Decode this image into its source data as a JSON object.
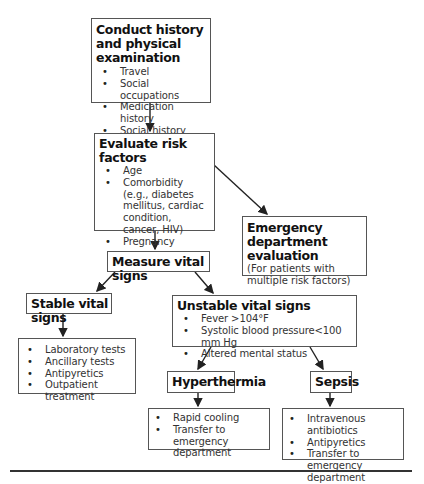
{
  "nodes": {
    "history": {
      "title": "Conduct history and physical examination",
      "items": [
        "Travel",
        "Social occupations",
        "Medication history",
        "Social history"
      ]
    },
    "risk": {
      "title": "Evaluate risk factors",
      "items": [
        "Age",
        "Comorbidity (e.g., diabetes mellitus, cardiac condition, cancer, HIV)",
        "Pregnancy"
      ]
    },
    "ed_eval": {
      "title": "Emergency department evaluation",
      "note": "(For patients with multiple risk factors)"
    },
    "measure": {
      "title": "Measure vital signs"
    },
    "stable": {
      "title": "Stable vital signs"
    },
    "stable_actions": {
      "items": [
        "Laboratory tests",
        "Ancillary tests",
        "Antipyretics",
        "Outpatient treatment"
      ]
    },
    "unstable": {
      "title": "Unstable vital signs",
      "items": [
        "Fever >104°F",
        "Systolic blood pressure<100 mm Hg",
        "Altered mental status"
      ]
    },
    "hyperthermia": {
      "title": "Hyperthermia"
    },
    "hyperthermia_actions": {
      "items": [
        "Rapid cooling",
        "Transfer to emergency department"
      ]
    },
    "sepsis": {
      "title": "Sepsis"
    },
    "sepsis_actions": {
      "items": [
        "Intravenous antibiotics",
        "Antipyretics",
        "Transfer to emergency department"
      ]
    }
  },
  "edges": [
    {
      "from": "history",
      "to": "risk"
    },
    {
      "from": "risk",
      "to": "measure"
    },
    {
      "from": "risk",
      "to": "ed_eval"
    },
    {
      "from": "measure",
      "to": "stable"
    },
    {
      "from": "measure",
      "to": "unstable"
    },
    {
      "from": "stable",
      "to": "stable_actions"
    },
    {
      "from": "unstable",
      "to": "hyperthermia"
    },
    {
      "from": "unstable",
      "to": "sepsis"
    },
    {
      "from": "hyperthermia",
      "to": "hyperthermia_actions"
    },
    {
      "from": "sepsis",
      "to": "sepsis_actions"
    }
  ]
}
